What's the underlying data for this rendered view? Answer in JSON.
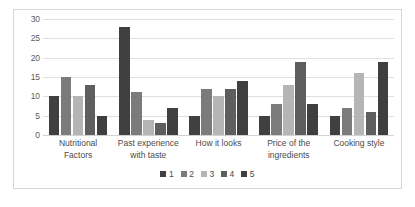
{
  "chart_data": {
    "type": "bar",
    "title": "",
    "subtitle": "",
    "xlabel": "",
    "ylabel": "",
    "ylim": [
      0,
      30
    ],
    "yticks": [
      0,
      5,
      10,
      15,
      20,
      25,
      30
    ],
    "ytick_labels": [
      "0",
      "5",
      "10",
      "15",
      "20",
      "25",
      "30"
    ],
    "grid": true,
    "legend_position": "bottom-center",
    "categories": [
      "Nutritional Factors",
      "Past experience with taste",
      "How it looks",
      "Price of the ingredients",
      "Cooking style"
    ],
    "series": [
      {
        "name": "1",
        "color": "#404040",
        "values": [
          10,
          28,
          5,
          5,
          5
        ]
      },
      {
        "name": "2",
        "color": "#7b7b7b",
        "values": [
          15,
          11,
          12,
          8,
          7
        ]
      },
      {
        "name": "3",
        "color": "#b5b5b5",
        "values": [
          10,
          4,
          10,
          13,
          16
        ]
      },
      {
        "name": "4",
        "color": "#5e5e5e",
        "values": [
          13,
          3,
          12,
          19,
          6
        ]
      },
      {
        "name": "5",
        "color": "#3f3f3f",
        "values": [
          5,
          7,
          14,
          8,
          19
        ]
      }
    ]
  },
  "legend": {
    "entries": [
      {
        "label": "1",
        "color": "#404040"
      },
      {
        "label": "2",
        "color": "#7b7b7b"
      },
      {
        "label": "3",
        "color": "#b5b5b5"
      },
      {
        "label": "4",
        "color": "#5e5e5e"
      },
      {
        "label": "5",
        "color": "#3f3f3f"
      }
    ]
  },
  "style": {
    "gridline_color": "#dfdfdf",
    "border_color": "#d6d6d6",
    "text_color": "#4a4a4a",
    "background": "#ffffff"
  }
}
